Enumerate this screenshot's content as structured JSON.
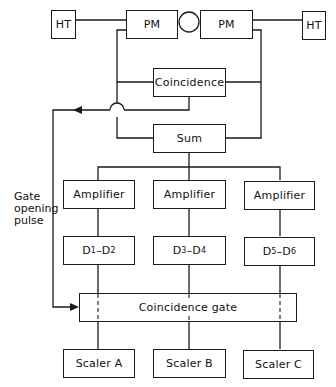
{
  "diagram": {
    "type": "block-diagram",
    "blocks": {
      "ht_left": "HT",
      "pm_left": "PM",
      "pm_right": "PM",
      "ht_right": "HT",
      "coincidence": "Coincidence",
      "sum": "Sum",
      "amp_1": "Amplifier",
      "amp_2": "Amplifier",
      "amp_3": "Amplifier",
      "disc_1": {
        "a": "D",
        "a_sub": "1",
        "sep": "–",
        "b": "D",
        "b_sub": "2"
      },
      "disc_2": {
        "a": "D",
        "a_sub": "3",
        "sep": "–",
        "b": "D",
        "b_sub": "4"
      },
      "disc_3": {
        "a": "D",
        "a_sub": "5",
        "sep": "–",
        "b": "D",
        "b_sub": "6"
      },
      "coincidence_gate": "Coincidence gate",
      "scaler_a": "Scaler A",
      "scaler_b": "Scaler B",
      "scaler_c": "Scaler C"
    },
    "labels": {
      "gate_line1": "Gate",
      "gate_line2": "opening",
      "gate_line3": "pulse"
    },
    "colors": {
      "line": "#1a1a1a",
      "background": "#ffffff"
    }
  }
}
